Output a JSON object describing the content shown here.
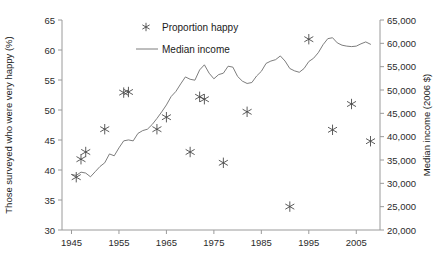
{
  "chart_data": {
    "type": "scatter",
    "title": "",
    "xlabel": "",
    "ylabel": "Those surveyed who were very happy (%)",
    "y2label": "Median income (2006 $)",
    "xlim": [
      1943,
      2010
    ],
    "ylim": [
      30,
      65
    ],
    "y2lim": [
      20000,
      65000
    ],
    "grid": false,
    "legend_position": "top-center",
    "xticks": [
      1945,
      1955,
      1965,
      1975,
      1985,
      1995,
      2005
    ],
    "xticklabels": [
      "1945",
      "1955",
      "1965",
      "1975",
      "1985",
      "1995",
      "2005"
    ],
    "yticks": [
      30,
      35,
      40,
      45,
      50,
      55,
      60,
      65
    ],
    "yticklabels": [
      "30",
      "35",
      "40",
      "45",
      "50",
      "55",
      "60",
      "65"
    ],
    "y2ticks": [
      20000,
      25000,
      30000,
      35000,
      40000,
      45000,
      50000,
      55000,
      60000,
      65000
    ],
    "y2ticklabels": [
      "20,000",
      "25,000",
      "30,000",
      "35,000",
      "40,000",
      "45,000",
      "50,000",
      "55,000",
      "60,000",
      "65,000"
    ],
    "series": [
      {
        "name": "Proportion happy",
        "type": "scatter",
        "marker": "asterisk",
        "color": "#4a4a4a",
        "axis": "left",
        "points": [
          {
            "x": 1946,
            "y": 38.8
          },
          {
            "x": 1947,
            "y": 41.8
          },
          {
            "x": 1948,
            "y": 43.0
          },
          {
            "x": 1952,
            "y": 46.8
          },
          {
            "x": 1956,
            "y": 52.9
          },
          {
            "x": 1957,
            "y": 53.0
          },
          {
            "x": 1963,
            "y": 46.8
          },
          {
            "x": 1965,
            "y": 48.8
          },
          {
            "x": 1970,
            "y": 43.0
          },
          {
            "x": 1972,
            "y": 52.2
          },
          {
            "x": 1973,
            "y": 51.8
          },
          {
            "x": 1977,
            "y": 41.2
          },
          {
            "x": 1982,
            "y": 49.7
          },
          {
            "x": 1991,
            "y": 33.9
          },
          {
            "x": 1995,
            "y": 61.8
          },
          {
            "x": 2000,
            "y": 46.7
          },
          {
            "x": 2004,
            "y": 51.0
          },
          {
            "x": 2008,
            "y": 44.8
          }
        ]
      },
      {
        "name": "Median income",
        "type": "line",
        "color": "#6e6e6e",
        "axis": "right",
        "points": [
          {
            "x": 1945,
            "y": 31900
          },
          {
            "x": 1946,
            "y": 31700
          },
          {
            "x": 1947,
            "y": 32400
          },
          {
            "x": 1948,
            "y": 32200
          },
          {
            "x": 1949,
            "y": 31400
          },
          {
            "x": 1950,
            "y": 32500
          },
          {
            "x": 1951,
            "y": 33600
          },
          {
            "x": 1952,
            "y": 34400
          },
          {
            "x": 1953,
            "y": 36300
          },
          {
            "x": 1954,
            "y": 35900
          },
          {
            "x": 1955,
            "y": 37600
          },
          {
            "x": 1956,
            "y": 39100
          },
          {
            "x": 1957,
            "y": 39300
          },
          {
            "x": 1958,
            "y": 39100
          },
          {
            "x": 1959,
            "y": 40700
          },
          {
            "x": 1960,
            "y": 41300
          },
          {
            "x": 1961,
            "y": 41600
          },
          {
            "x": 1962,
            "y": 42600
          },
          {
            "x": 1963,
            "y": 43900
          },
          {
            "x": 1964,
            "y": 45300
          },
          {
            "x": 1965,
            "y": 46800
          },
          {
            "x": 1966,
            "y": 48600
          },
          {
            "x": 1967,
            "y": 49700
          },
          {
            "x": 1968,
            "y": 51300
          },
          {
            "x": 1969,
            "y": 52800
          },
          {
            "x": 1970,
            "y": 52300
          },
          {
            "x": 1971,
            "y": 52100
          },
          {
            "x": 1972,
            "y": 54300
          },
          {
            "x": 1973,
            "y": 55400
          },
          {
            "x": 1974,
            "y": 53600
          },
          {
            "x": 1975,
            "y": 52400
          },
          {
            "x": 1976,
            "y": 53300
          },
          {
            "x": 1977,
            "y": 53600
          },
          {
            "x": 1978,
            "y": 55100
          },
          {
            "x": 1979,
            "y": 54900
          },
          {
            "x": 1980,
            "y": 52900
          },
          {
            "x": 1981,
            "y": 51900
          },
          {
            "x": 1982,
            "y": 51400
          },
          {
            "x": 1983,
            "y": 51600
          },
          {
            "x": 1984,
            "y": 53000
          },
          {
            "x": 1985,
            "y": 54000
          },
          {
            "x": 1986,
            "y": 55700
          },
          {
            "x": 1987,
            "y": 56200
          },
          {
            "x": 1988,
            "y": 56500
          },
          {
            "x": 1989,
            "y": 57300
          },
          {
            "x": 1990,
            "y": 56200
          },
          {
            "x": 1991,
            "y": 54600
          },
          {
            "x": 1992,
            "y": 54100
          },
          {
            "x": 1993,
            "y": 53800
          },
          {
            "x": 1994,
            "y": 54600
          },
          {
            "x": 1995,
            "y": 56100
          },
          {
            "x": 1996,
            "y": 56800
          },
          {
            "x": 1997,
            "y": 58000
          },
          {
            "x": 1998,
            "y": 59700
          },
          {
            "x": 1999,
            "y": 61000
          },
          {
            "x": 2000,
            "y": 61200
          },
          {
            "x": 2001,
            "y": 60100
          },
          {
            "x": 2002,
            "y": 59600
          },
          {
            "x": 2003,
            "y": 59400
          },
          {
            "x": 2004,
            "y": 59300
          },
          {
            "x": 2005,
            "y": 59400
          },
          {
            "x": 2006,
            "y": 59900
          },
          {
            "x": 2007,
            "y": 60300
          },
          {
            "x": 2008,
            "y": 59800
          }
        ]
      }
    ],
    "legend": [
      {
        "label": "Proportion happy",
        "marker": "asterisk"
      },
      {
        "label": "Median income",
        "marker": "line"
      }
    ]
  }
}
